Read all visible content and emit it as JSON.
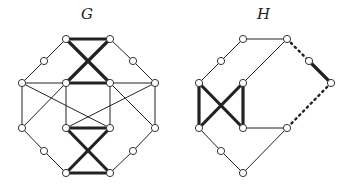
{
  "graphs": [
    {
      "id": "G",
      "label": "G",
      "label_pos": [
        81,
        5
      ],
      "nodes": [
        [
          66,
          39
        ],
        [
          110,
          39
        ],
        [
          44,
          61
        ],
        [
          133,
          61
        ],
        [
          22,
          83
        ],
        [
          66,
          83
        ],
        [
          110,
          83
        ],
        [
          155,
          83
        ],
        [
          22,
          128
        ],
        [
          66,
          128
        ],
        [
          110,
          128
        ],
        [
          155,
          128
        ],
        [
          44,
          151
        ],
        [
          133,
          151
        ],
        [
          66,
          173
        ],
        [
          110,
          173
        ]
      ],
      "thin_edges": [
        [
          0,
          2
        ],
        [
          2,
          4
        ],
        [
          1,
          3
        ],
        [
          3,
          7
        ],
        [
          4,
          8
        ],
        [
          7,
          11
        ],
        [
          5,
          9
        ],
        [
          6,
          10
        ],
        [
          4,
          10
        ],
        [
          5,
          8
        ],
        [
          8,
          12
        ],
        [
          12,
          14
        ],
        [
          7,
          9
        ],
        [
          6,
          11
        ],
        [
          11,
          13
        ],
        [
          13,
          15
        ],
        [
          5,
          4
        ],
        [
          6,
          7
        ]
      ],
      "thick_edges": [
        [
          0,
          1
        ],
        [
          0,
          6
        ],
        [
          1,
          5
        ],
        [
          5,
          6
        ],
        [
          9,
          10
        ],
        [
          9,
          15
        ],
        [
          10,
          14
        ],
        [
          14,
          15
        ]
      ],
      "dotted_edges": []
    },
    {
      "id": "H",
      "label": "H",
      "label_pos": [
        257,
        5
      ],
      "nodes": [
        [
          243,
          39
        ],
        [
          287,
          39
        ],
        [
          221,
          61
        ],
        [
          309,
          61
        ],
        [
          199,
          83
        ],
        [
          243,
          83
        ],
        [
          331,
          83
        ],
        [
          199,
          128
        ],
        [
          243,
          128
        ],
        [
          287,
          128
        ],
        [
          221,
          151
        ],
        [
          243,
          173
        ]
      ],
      "thin_edges": [
        [
          0,
          1
        ],
        [
          0,
          2
        ],
        [
          2,
          4
        ],
        [
          1,
          5
        ],
        [
          8,
          9
        ],
        [
          7,
          10
        ],
        [
          10,
          11
        ],
        [
          11,
          9
        ]
      ],
      "thick_edges": [
        [
          4,
          7
        ],
        [
          5,
          8
        ],
        [
          4,
          8
        ],
        [
          5,
          7
        ],
        [
          3,
          6
        ]
      ],
      "dotted_edges": [
        [
          1,
          3
        ],
        [
          6,
          9
        ]
      ]
    }
  ],
  "colors": {
    "edge": "#222222",
    "node_fill": "#ffffff",
    "node_stroke": "#333333"
  }
}
